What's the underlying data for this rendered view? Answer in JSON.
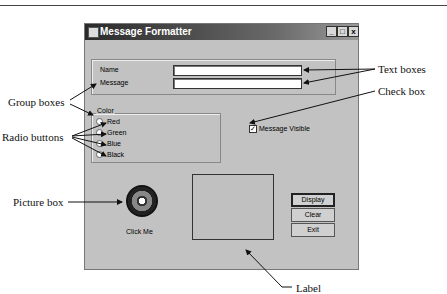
{
  "window": {
    "title": "Message Formatter",
    "controls": {
      "minimize": "_",
      "maximize": "□",
      "close": "x"
    }
  },
  "inputs": {
    "name_label": "Name",
    "name_value": "",
    "message_label": "Message",
    "message_value": ""
  },
  "color_group": {
    "title": "Color",
    "options": [
      {
        "label": "Red"
      },
      {
        "label": "Green"
      },
      {
        "label": "Blue"
      },
      {
        "label": "Black"
      }
    ]
  },
  "checkbox": {
    "label": "Message Visible",
    "checked": true,
    "mark": "✓"
  },
  "picture": {
    "caption": "Click Me"
  },
  "buttons": {
    "display": "Display",
    "clear": "Clear",
    "exit": "Exit"
  },
  "callouts": {
    "group_boxes": "Group boxes",
    "radio_buttons": "Radio buttons",
    "picture_box": "Picture box",
    "text_boxes": "Text boxes",
    "check_box": "Check box",
    "label": "Label"
  }
}
